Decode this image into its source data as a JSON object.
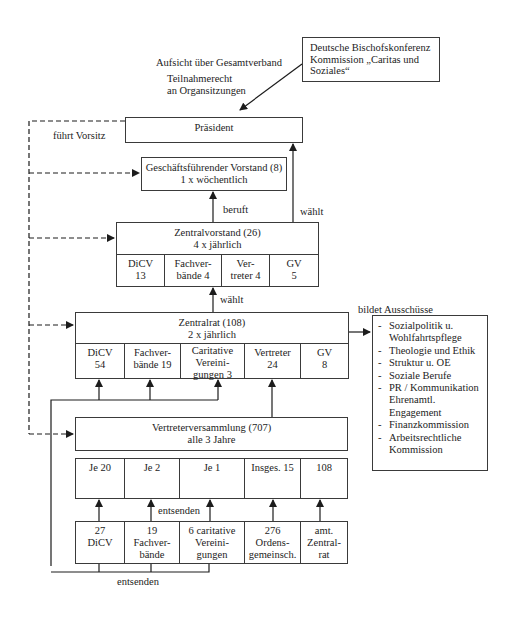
{
  "annotations": {
    "aufsicht": "Aufsicht über Gesamtverband",
    "teilnahme_line1": "Teilnahmerecht",
    "teilnahme_line2": "an Organsitzungen",
    "fuehrt_vorsitz": "führt Vorsitz",
    "beruft": "beruft",
    "waehlt_praesident": "wählt",
    "waehlt_zentralvorstand": "wählt",
    "bildet_ausschuesse": "bildet Ausschüsse",
    "entsenden_upper": "entsenden",
    "entsenden_lower": "entsenden"
  },
  "bischofskonferenz": {
    "line1": "Deutsche Bischofskonferenz",
    "line2": "Kommission „Caritas und",
    "line3": "Soziales“"
  },
  "praesident": {
    "title": "Präsident"
  },
  "geschaeftsfuehrender_vorstand": {
    "title": "Geschäftsführender Vorstand (8)",
    "frequency": "1 x wöchentlich"
  },
  "zentralvorstand": {
    "title": "Zentralvorstand (26)",
    "frequency": "4 x jährlich",
    "cells": [
      {
        "line1": "DiCV",
        "line2": "13"
      },
      {
        "line1": "Fachver-",
        "line2": "bände 4"
      },
      {
        "line1": "Ver-",
        "line2": "treter 4"
      },
      {
        "line1": "GV",
        "line2": "5"
      }
    ]
  },
  "zentralrat": {
    "title": "Zentralrat (108)",
    "frequency": "2 x jährlich",
    "cells": [
      {
        "line1": "DiCV",
        "line2": "54",
        "line3": ""
      },
      {
        "line1": "Fachver-",
        "line2": "bände 19",
        "line3": ""
      },
      {
        "line1": "Caritative",
        "line2": "Vereini-",
        "line3": "gungen 3"
      },
      {
        "line1": "Vertreter",
        "line2": "24",
        "line3": ""
      },
      {
        "line1": "GV",
        "line2": "8",
        "line3": ""
      }
    ]
  },
  "ausschuesse": {
    "items": [
      "Sozialpolitik u. Wohlfahrtspflege",
      "Theologie und Ethik",
      "Struktur u. OE",
      "Soziale Berufe",
      "PR / Kommunikation Ehrenamtl. Engagement",
      "Finanzkommission",
      "Arbeitsrechtliche Kommission"
    ]
  },
  "vertreterversammlung": {
    "title": "Vertreterversammlung (707)",
    "frequency": "alle 3 Jahre",
    "cells": [
      "Je 20",
      "Je 2",
      "Je 1",
      "Insges. 15",
      "108"
    ]
  },
  "mitglieder": {
    "cells": [
      {
        "line1": "27",
        "line2": "DiCV",
        "line3": ""
      },
      {
        "line1": "19",
        "line2": "Fachver-",
        "line3": "bände"
      },
      {
        "line1": "6 caritative",
        "line2": "Vereini-",
        "line3": "gungen"
      },
      {
        "line1": "276",
        "line2": "Ordens-",
        "line3": "gemeinsch."
      },
      {
        "line1": "amt.",
        "line2": "Zentral-",
        "line3": "rat"
      }
    ]
  }
}
